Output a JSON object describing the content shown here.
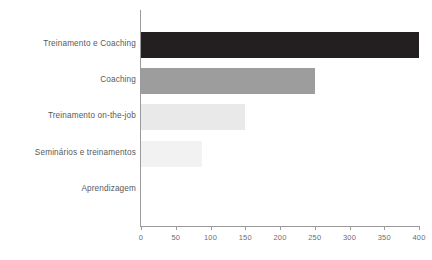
{
  "chart_data": {
    "type": "bar",
    "orientation": "horizontal",
    "title": "",
    "subtitle": "",
    "xlabel": "",
    "ylabel": "",
    "categories": [
      "Treinamento e Coaching",
      "Coaching",
      "Treinamento on-the-job",
      "Seminários e treinamentos",
      "Aprendizagem"
    ],
    "values": [
      400,
      250,
      150,
      88,
      0
    ],
    "bar_colors": [
      "#231f20",
      "#9d9d9d",
      "#e9e9e9",
      "#f2f2f2",
      "#ffffff"
    ],
    "xlim": [
      0,
      400
    ],
    "xticks": [
      0,
      50,
      100,
      150,
      200,
      250,
      300,
      350,
      400
    ],
    "xtick_labels": [
      "0",
      "50",
      "100",
      "150",
      "200",
      "250",
      "300",
      "350",
      "400"
    ],
    "grid": false,
    "legend": null,
    "annotations": []
  },
  "style": {
    "axis_color": "#9a9a9a",
    "tick_label_color": "#6d6e71",
    "category_label_color": "#58595b",
    "background": "#ffffff"
  }
}
